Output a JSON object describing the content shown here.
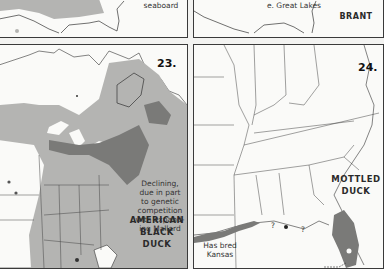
{
  "panels": [
    {
      "id": "top-left",
      "note": "seaboard"
    },
    {
      "id": "top-right",
      "note": "e. Great Lakes",
      "species": "BRANT"
    },
    {
      "id": "map-23",
      "number": "23.",
      "species_lines": [
        "AMERICAN",
        "BLACK",
        "DUCK"
      ],
      "note_lines": [
        "Declining,",
        "due in part",
        "to genetic",
        "competition",
        "with expand-",
        "ing Mallard"
      ]
    },
    {
      "id": "map-24",
      "number": "24.",
      "species_lines": [
        "MOTTLED",
        "DUCK"
      ],
      "note_lines": [
        "Has bred",
        "Kansas"
      ],
      "question_marks": [
        "?",
        "?"
      ]
    }
  ],
  "colors": {
    "range_light": "#b4b4b2",
    "range_dark": "#7a7a78",
    "border": "#3a3a3a",
    "paper": "#fafaf8"
  }
}
